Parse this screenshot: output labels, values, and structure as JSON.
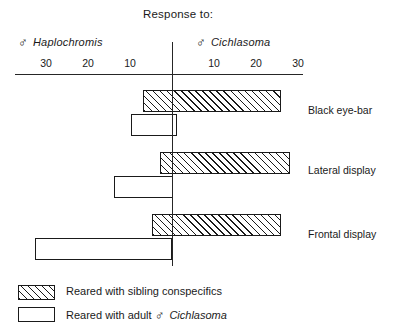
{
  "chart_data": {
    "type": "bar",
    "orientation": "horizontal",
    "title": "Response to:",
    "xlabel": "",
    "ylabel": "",
    "left_axis_header": "♂ Haplochromis",
    "right_axis_header": "♂ Cichlasoma",
    "left_header_symbol": "♂",
    "left_header_species": "Haplochromis",
    "right_header_symbol": "♂",
    "right_header_species": "Cichlasoma",
    "axis_note": "Diverging axis: values left of zero are responses to male Haplochromis, values right of zero are responses to male Cichlasoma.",
    "xlim": [
      -34,
      31
    ],
    "grid": false,
    "tick_labels_left": [
      "30",
      "20",
      "10"
    ],
    "tick_labels_right": [
      "10",
      "20",
      "30"
    ],
    "ticks": [
      -30,
      -20,
      -10,
      10,
      20,
      30
    ],
    "categories": [
      "Black eye-bar",
      "Lateral display",
      "Frontal display"
    ],
    "legend_position": "bottom-left",
    "series": [
      {
        "name": "Reared with sibling conspecifics",
        "fill": "hatched",
        "left_values": [
          7,
          3,
          5
        ],
        "right_values": [
          26,
          28,
          26
        ]
      },
      {
        "name": "Reared with adult ♂ Cichlasoma",
        "fill": "white",
        "left_values": [
          10,
          14,
          33
        ],
        "right_values": [
          1,
          0,
          0
        ]
      }
    ]
  },
  "title": {
    "text": "Response to:"
  },
  "headers": {
    "left": {
      "symbol": "♂",
      "species": "Haplochromis"
    },
    "right": {
      "symbol": "♂",
      "species": "Cichlasoma"
    }
  },
  "axis": {
    "ticks": [
      {
        "label": "30",
        "value": -30
      },
      {
        "label": "20",
        "value": -20
      },
      {
        "label": "10",
        "value": -10
      },
      {
        "label": "10",
        "value": 10
      },
      {
        "label": "20",
        "value": 20
      },
      {
        "label": "30",
        "value": 30
      }
    ]
  },
  "categories": [
    {
      "label": "Black eye-bar"
    },
    {
      "label": "Lateral display"
    },
    {
      "label": "Frontal display"
    }
  ],
  "legend": {
    "items": [
      {
        "key": "hatched",
        "label": "Reared with sibling conspecifics"
      },
      {
        "key": "white",
        "label_before": "Reared with adult ",
        "symbol": "♂",
        "species": "Cichlasoma"
      }
    ]
  }
}
